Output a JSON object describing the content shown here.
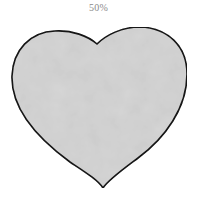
{
  "label": "50%",
  "heart": {
    "fill": "#d6d6d6",
    "stroke": "#1a1a1a"
  }
}
